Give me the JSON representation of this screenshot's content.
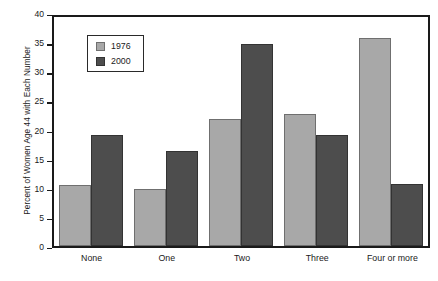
{
  "chart_data": {
    "type": "bar",
    "title": "",
    "xlabel": "",
    "ylabel": "Percent of Women Age 44 with Each Number",
    "ylim": [
      0,
      40
    ],
    "ytick_step": 5,
    "yticks": [
      40,
      35,
      30,
      25,
      20,
      15,
      10,
      5,
      0
    ],
    "grid": false,
    "legend_position": "upper-left-inside",
    "categories": [
      "None",
      "One",
      "Two",
      "Three",
      "Four or more"
    ],
    "series": [
      {
        "name": "1976",
        "color": "#a8a8a8",
        "values": [
          10.5,
          9.8,
          22.0,
          22.8,
          36.0
        ]
      },
      {
        "name": "2000",
        "color": "#4d4d4d",
        "values": [
          19.2,
          16.5,
          35.0,
          19.2,
          10.8
        ]
      }
    ]
  }
}
